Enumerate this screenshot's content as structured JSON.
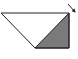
{
  "diagram": {
    "outline_color": "#222222",
    "fill_color": "#7a7a7a",
    "background": "#ffffff",
    "shapes": [
      {
        "name": "trapezoid-outline",
        "points": "1,13 69,13 69,48 35,48"
      },
      {
        "name": "shaded-triangle",
        "points": "35,48 69,13 69,48"
      }
    ],
    "arrow": {
      "x1": 68,
      "y1": 4,
      "x2": 76,
      "y2": 13
    }
  }
}
